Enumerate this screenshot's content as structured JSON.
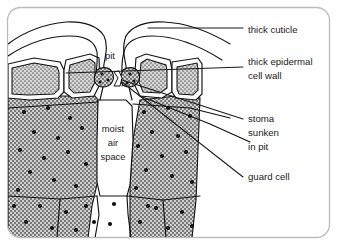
{
  "figure": {
    "background_color": "#ffffff",
    "frame_color": "#bcbcbc",
    "ink_color": "#1a1a1a"
  },
  "diagram_labels": [
    {
      "id": "pit",
      "text": "pit",
      "x": 110,
      "y": 57
    },
    {
      "id": "moist-air-space-line1",
      "text": "moist",
      "x": 113,
      "y": 130
    },
    {
      "id": "moist-air-space-line2",
      "text": "air",
      "x": 113,
      "y": 144
    },
    {
      "id": "moist-air-space-line3",
      "text": "space",
      "x": 113,
      "y": 158
    }
  ],
  "callouts": [
    {
      "id": "thick-cuticle",
      "lines": [
        "thick cuticle"
      ],
      "text_x": 248,
      "text_y": 30,
      "leader_points": "148,28 243,28"
    },
    {
      "id": "thick-epidermal-cell-wall",
      "lines": [
        "thick epidermal",
        "cell wall"
      ],
      "text_x": 248,
      "text_y": 67,
      "leader_points": "66,73 243,67"
    },
    {
      "id": "stoma-sunken-in-pit",
      "lines": [
        "stoma",
        "sunken",
        "in pit"
      ],
      "text_x": 248,
      "text_y": 119,
      "leader_points": "122,80 243,119"
    },
    {
      "id": "guard-cell",
      "lines": [
        "guard cell"
      ],
      "text_x": 248,
      "text_y": 177,
      "leader_points": "122,82 243,177"
    }
  ],
  "colors": {
    "stipple_fill": "#c9c9c9",
    "chloroplast_dot": "#111111",
    "outline": "#111111",
    "cell_wall_white": "#ffffff"
  }
}
